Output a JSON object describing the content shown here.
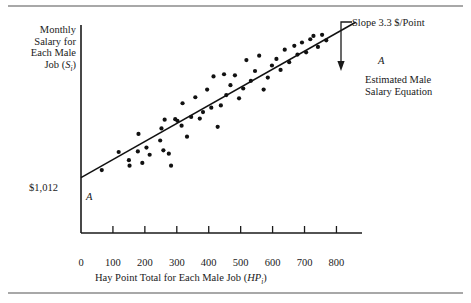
{
  "figure": {
    "background": "#ffffff",
    "rule_color": "#a8a8a8",
    "ink_color": "#1a1a1a"
  },
  "axes": {
    "y_label_lines": [
      "Monthly",
      "Salary for",
      "Each Male",
      "Job (S"
    ],
    "y_label_subscript": "i",
    "y_label_close": ")",
    "y_intercept_label": "$1,012",
    "x_label_main": "Hay Point Total for Each Male Job (HP",
    "x_label_subscript": "i",
    "x_label_close": ")",
    "x_ticks": [
      "0",
      "100",
      "200",
      "300",
      "400",
      "500",
      "600",
      "700",
      "800"
    ]
  },
  "annotations": {
    "slope_note": "Slope 3.3 $/Point",
    "line_label_low": "A",
    "line_label_high": "A",
    "equation_line1": "Estimated Male",
    "equation_line2": "Salary Equation"
  },
  "chart_data": {
    "type": "scatter",
    "title": "",
    "xlabel": "Hay Point Total for Each Male Job (HP_i)",
    "ylabel": "Monthly Salary for Each Male Job (S_i)",
    "xlim": [
      0,
      880
    ],
    "ylim": [
      0,
      3800
    ],
    "grid": false,
    "legend": null,
    "xticks": [
      0,
      100,
      200,
      300,
      400,
      500,
      600,
      700,
      800
    ],
    "yticks": [
      1012
    ],
    "ytick_labels": [
      "$1,012"
    ],
    "regression_line": {
      "label": "A",
      "intercept": 1012,
      "slope": 3.3,
      "slope_note": "Slope 3.3 $/Point",
      "description": "Estimated Male Salary Equation",
      "x_start": 0,
      "x_end": 860
    },
    "points": [
      [
        65,
        1150
      ],
      [
        118,
        1480
      ],
      [
        150,
        1330
      ],
      [
        152,
        1230
      ],
      [
        178,
        1490
      ],
      [
        180,
        1810
      ],
      [
        192,
        1280
      ],
      [
        205,
        1560
      ],
      [
        215,
        1430
      ],
      [
        248,
        1690
      ],
      [
        252,
        1910
      ],
      [
        258,
        1510
      ],
      [
        262,
        2070
      ],
      [
        275,
        1450
      ],
      [
        282,
        1230
      ],
      [
        295,
        2080
      ],
      [
        302,
        2050
      ],
      [
        315,
        1960
      ],
      [
        318,
        2370
      ],
      [
        332,
        1760
      ],
      [
        345,
        2120
      ],
      [
        358,
        2480
      ],
      [
        372,
        2090
      ],
      [
        382,
        2210
      ],
      [
        395,
        2620
      ],
      [
        408,
        2290
      ],
      [
        415,
        2860
      ],
      [
        428,
        1940
      ],
      [
        438,
        2330
      ],
      [
        448,
        2900
      ],
      [
        455,
        2520
      ],
      [
        468,
        2700
      ],
      [
        482,
        2880
      ],
      [
        495,
        2460
      ],
      [
        508,
        2640
      ],
      [
        518,
        3160
      ],
      [
        532,
        2780
      ],
      [
        545,
        2960
      ],
      [
        558,
        3240
      ],
      [
        572,
        2620
      ],
      [
        585,
        2840
      ],
      [
        598,
        3060
      ],
      [
        612,
        3180
      ],
      [
        625,
        2980
      ],
      [
        638,
        3350
      ],
      [
        652,
        3120
      ],
      [
        668,
        3420
      ],
      [
        678,
        3260
      ],
      [
        692,
        3480
      ],
      [
        705,
        3300
      ],
      [
        718,
        3540
      ],
      [
        728,
        3600
      ],
      [
        742,
        3400
      ],
      [
        755,
        3620
      ],
      [
        768,
        3520
      ]
    ]
  }
}
